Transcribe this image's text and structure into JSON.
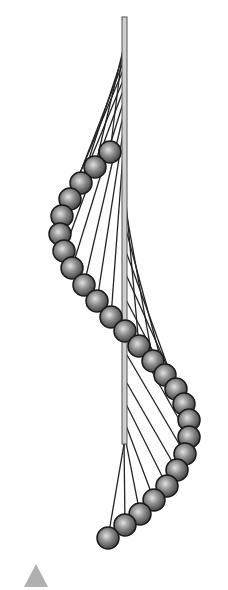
{
  "figure": {
    "rod": {
      "x": 122,
      "y_top": 17,
      "y_bottom": 444,
      "width": 5,
      "fill": "#cfcfcf",
      "stroke": "#555555"
    },
    "string_color": "#222222",
    "ball": {
      "radius": 11,
      "light": "#d8d8d8",
      "mid": "#8a8a8a",
      "dark": "#3a3a3a",
      "outline": "#1a1a1a"
    },
    "pendulums": [
      {
        "ax": 124,
        "ay": 40,
        "bx": 110,
        "by": 152
      },
      {
        "ax": 124,
        "ay": 46,
        "bx": 95,
        "by": 167
      },
      {
        "ax": 124,
        "ay": 52,
        "bx": 81,
        "by": 183
      },
      {
        "ax": 124,
        "ay": 60,
        "bx": 70,
        "by": 199
      },
      {
        "ax": 124,
        "ay": 68,
        "bx": 62,
        "by": 216
      },
      {
        "ax": 124,
        "ay": 78,
        "bx": 60,
        "by": 234
      },
      {
        "ax": 124,
        "ay": 88,
        "bx": 64,
        "by": 251
      },
      {
        "ax": 124,
        "ay": 100,
        "bx": 72,
        "by": 268
      },
      {
        "ax": 124,
        "ay": 112,
        "bx": 84,
        "by": 285
      },
      {
        "ax": 124,
        "ay": 126,
        "bx": 97,
        "by": 301
      },
      {
        "ax": 124,
        "ay": 140,
        "bx": 111,
        "by": 317
      },
      {
        "ax": 124,
        "ay": 160,
        "bx": 125,
        "by": 331
      },
      {
        "ax": 124,
        "ay": 180,
        "bx": 139,
        "by": 346
      },
      {
        "ax": 124,
        "ay": 200,
        "bx": 153,
        "by": 361
      },
      {
        "ax": 124,
        "ay": 222,
        "bx": 165,
        "by": 375
      },
      {
        "ax": 124,
        "ay": 246,
        "bx": 176,
        "by": 389
      },
      {
        "ax": 124,
        "ay": 270,
        "bx": 184,
        "by": 404
      },
      {
        "ax": 124,
        "ay": 296,
        "bx": 189,
        "by": 420
      },
      {
        "ax": 124,
        "ay": 322,
        "bx": 189,
        "by": 437
      },
      {
        "ax": 124,
        "ay": 350,
        "bx": 185,
        "by": 454
      },
      {
        "ax": 124,
        "ay": 378,
        "bx": 177,
        "by": 470
      },
      {
        "ax": 124,
        "ay": 400,
        "bx": 167,
        "by": 486
      },
      {
        "ax": 124,
        "ay": 420,
        "bx": 154,
        "by": 500
      },
      {
        "ax": 124,
        "ay": 432,
        "bx": 140,
        "by": 514
      },
      {
        "ax": 124,
        "ay": 440,
        "bx": 125,
        "by": 525
      },
      {
        "ax": 124,
        "ay": 444,
        "bx": 108,
        "by": 538
      }
    ]
  },
  "controls": {
    "play_button": {
      "label": "",
      "color": "#b0b0b0"
    }
  }
}
